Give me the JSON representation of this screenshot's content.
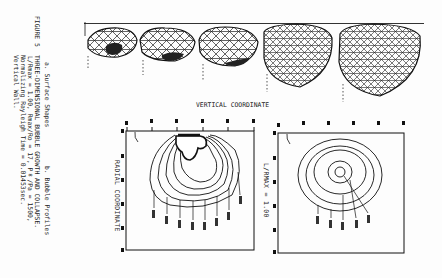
{
  "figure": {
    "number": "FIGURE 5",
    "title": "THREE-DIMENSIONAL BUBBLE GROWTH AND COLLAPSE.",
    "params_line": "L/Rmax = 1.00, Rmax/Ro = 17, P∞/Pa = 1500,",
    "normalizing_line": "Normalizing Rayleigh Time = 0.01453sec.",
    "wall_line": "Vertical Wall."
  },
  "panels": {
    "a": {
      "label": "a. Surface Shapes",
      "bubble_count": 5
    },
    "b": {
      "label": "b. Bubble Profiles"
    }
  },
  "plots": {
    "vertical_axis_label": "VERTICAL COORDINATE",
    "left": {
      "y_axis_label": "RADIAL COORDINATE",
      "plate_label": "PLATE",
      "ticks": [
        "0.0",
        "0.2",
        "0.4",
        "0.6",
        "0.8",
        "1.0"
      ]
    },
    "right": {
      "annotation": "L/RMAX = 1.00",
      "plate_label": "PLATE",
      "ticks": [
        "0.0",
        "0.2",
        "0.4",
        "0.6",
        "0.8",
        "1.0"
      ]
    }
  }
}
